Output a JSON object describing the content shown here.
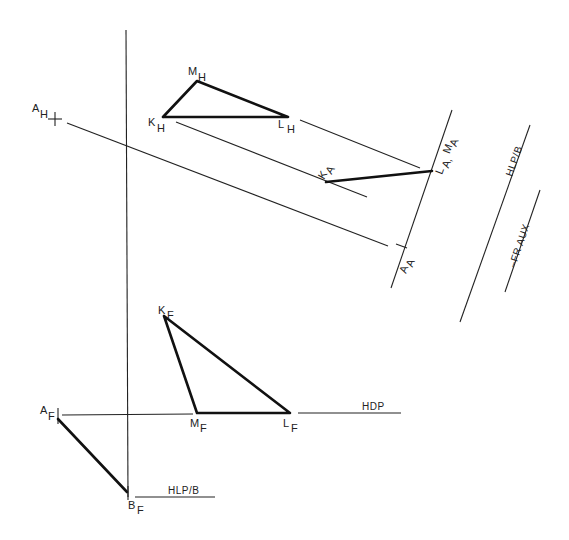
{
  "diagram": {
    "type": "descriptive-geometry-auxiliary-view",
    "labels": {
      "AH": {
        "main": "A",
        "sub": "H"
      },
      "MH": {
        "main": "M",
        "sub": "H"
      },
      "KH": {
        "main": "K",
        "sub": "H"
      },
      "LH": {
        "main": "L",
        "sub": "H"
      },
      "KA": {
        "main": "K",
        "sub": "A"
      },
      "LAMA": {
        "main": "L",
        "sub": "A",
        "sep": ", ",
        "main2": "M",
        "sub2": "A"
      },
      "AA": {
        "main": "A",
        "sub": "A"
      },
      "KF": {
        "main": "K",
        "sub": "F"
      },
      "MF": {
        "main": "M",
        "sub": "F"
      },
      "LF": {
        "main": "L",
        "sub": "F"
      },
      "AF": {
        "main": "A",
        "sub": "F"
      },
      "BF": {
        "main": "B",
        "sub": "F"
      }
    },
    "line_labels": {
      "hdp": "HDP",
      "hlp_b_bottom": "HLP/B",
      "hlp_b_right": "HLP/B",
      "fr_aux": "–FR AUX"
    },
    "stroke_color": "#111111",
    "background": "#ffffff"
  }
}
